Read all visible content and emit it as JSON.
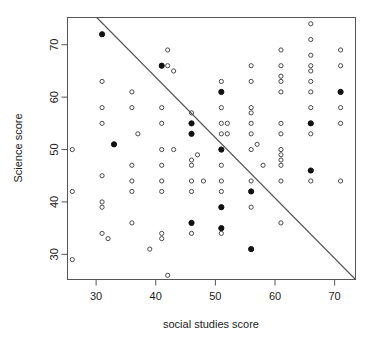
{
  "chart_data": {
    "type": "scatter",
    "title": "",
    "xlabel": "social studies score",
    "ylabel": "Science score",
    "xlim": [
      25.2,
      73.5
    ],
    "ylim": [
      25.2,
      75.2
    ],
    "xticks": [
      30,
      40,
      50,
      60,
      70
    ],
    "yticks": [
      30,
      40,
      50,
      60,
      70
    ],
    "xtick_labels": [
      "30",
      "40",
      "50",
      "60",
      "70"
    ],
    "ytick_labels": [
      "30",
      "40",
      "50",
      "60",
      "70"
    ],
    "grid": false,
    "legend": "none",
    "annotations": [
      {
        "name": "reference-line",
        "type": "line",
        "description": "downward sloping straight reference line",
        "x1": 30.1,
        "y1": 75.2,
        "x2": 73.5,
        "y2": 25.2
      }
    ],
    "series": [
      {
        "name": "open-points",
        "marker": "open-circle",
        "color": "#4a4a4a",
        "points": [
          [
            26,
            50
          ],
          [
            26,
            42
          ],
          [
            26,
            29
          ],
          [
            31,
            63
          ],
          [
            31,
            58
          ],
          [
            31,
            55
          ],
          [
            31,
            45
          ],
          [
            31,
            40
          ],
          [
            31,
            39
          ],
          [
            31,
            34
          ],
          [
            32,
            33
          ],
          [
            36,
            61
          ],
          [
            36,
            58
          ],
          [
            36,
            47
          ],
          [
            36,
            44
          ],
          [
            36,
            42
          ],
          [
            36,
            36
          ],
          [
            37,
            53
          ],
          [
            39,
            31
          ],
          [
            41,
            58
          ],
          [
            41,
            55
          ],
          [
            41,
            50
          ],
          [
            41,
            47
          ],
          [
            41,
            44
          ],
          [
            41,
            42
          ],
          [
            41,
            34
          ],
          [
            41,
            33
          ],
          [
            42,
            69
          ],
          [
            42,
            66
          ],
          [
            42,
            26
          ],
          [
            43,
            65
          ],
          [
            43,
            50
          ],
          [
            46,
            57
          ],
          [
            46,
            48
          ],
          [
            46,
            47
          ],
          [
            46,
            44
          ],
          [
            46,
            42
          ],
          [
            46,
            34
          ],
          [
            47,
            49
          ],
          [
            48,
            44
          ],
          [
            51,
            63
          ],
          [
            51,
            58
          ],
          [
            51,
            55
          ],
          [
            51,
            53
          ],
          [
            51,
            50
          ],
          [
            51,
            47
          ],
          [
            51,
            44
          ],
          [
            51,
            42
          ],
          [
            51,
            34
          ],
          [
            52,
            55
          ],
          [
            52,
            53
          ],
          [
            56,
            66
          ],
          [
            56,
            63
          ],
          [
            56,
            58
          ],
          [
            56,
            57
          ],
          [
            56,
            55
          ],
          [
            56,
            53
          ],
          [
            56,
            50
          ],
          [
            56,
            44
          ],
          [
            56,
            39
          ],
          [
            57,
            51
          ],
          [
            58,
            47
          ],
          [
            61,
            69
          ],
          [
            61,
            66
          ],
          [
            61,
            64
          ],
          [
            61,
            63
          ],
          [
            61,
            61
          ],
          [
            61,
            55
          ],
          [
            61,
            53
          ],
          [
            61,
            50
          ],
          [
            61,
            49
          ],
          [
            61,
            48
          ],
          [
            61,
            47
          ],
          [
            61,
            44
          ],
          [
            61,
            36
          ],
          [
            66,
            74
          ],
          [
            66,
            71
          ],
          [
            66,
            68
          ],
          [
            66,
            66
          ],
          [
            66,
            65
          ],
          [
            66,
            63
          ],
          [
            66,
            61
          ],
          [
            66,
            58
          ],
          [
            66,
            55
          ],
          [
            66,
            53
          ],
          [
            66,
            44
          ],
          [
            71,
            69
          ],
          [
            71,
            66
          ],
          [
            71,
            58
          ],
          [
            71,
            55
          ],
          [
            71,
            44
          ]
        ]
      },
      {
        "name": "filled-points",
        "marker": "filled-circle",
        "color": "#111111",
        "points": [
          [
            31,
            72
          ],
          [
            33,
            51
          ],
          [
            41,
            66
          ],
          [
            46,
            55
          ],
          [
            46,
            53
          ],
          [
            46,
            36
          ],
          [
            51,
            61
          ],
          [
            51,
            50
          ],
          [
            51,
            39
          ],
          [
            51,
            35
          ],
          [
            56,
            42
          ],
          [
            56,
            31
          ],
          [
            66,
            55
          ],
          [
            66,
            46
          ],
          [
            71,
            61
          ]
        ]
      }
    ]
  },
  "axes": {
    "x_axis_name": "x-axis",
    "y_axis_name": "y-axis"
  }
}
